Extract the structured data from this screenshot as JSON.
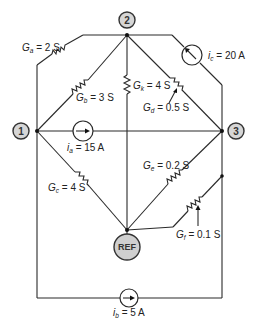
{
  "nodes": {
    "n1": {
      "label": "1"
    },
    "n2": {
      "label": "2"
    },
    "n3": {
      "label": "3"
    },
    "ref": {
      "label": "REF"
    }
  },
  "conductances": {
    "Ga": {
      "symbol": "G",
      "sub": "a",
      "value": "= 2 S"
    },
    "Gb": {
      "symbol": "G",
      "sub": "b",
      "value": "= 3 S"
    },
    "Gc": {
      "symbol": "G",
      "sub": "c",
      "value": "= 4 S"
    },
    "Gd": {
      "symbol": "G",
      "sub": "d",
      "value": "= 0.5 S"
    },
    "Ge": {
      "symbol": "G",
      "sub": "e",
      "value": "= 0.2 S"
    },
    "Gf": {
      "symbol": "G",
      "sub": "f",
      "value": "= 0.1 S"
    },
    "Gk": {
      "symbol": "G",
      "sub": "k",
      "value": "= 4 S"
    }
  },
  "sources": {
    "ia": {
      "symbol": "i",
      "sub": "a",
      "value": "= 15 A"
    },
    "ib": {
      "symbol": "i",
      "sub": "b",
      "value": "= 5 A"
    },
    "ic": {
      "symbol": "i",
      "sub": "c",
      "value": "= 20 A"
    }
  },
  "colors": {
    "wire": "#2a2a2a",
    "node_fill": "#d6d6d6",
    "ref_fill": "#cfcfcf"
  }
}
